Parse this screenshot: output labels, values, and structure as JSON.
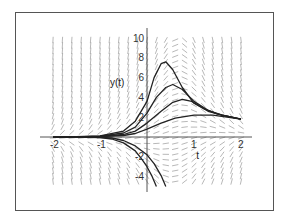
{
  "chart_data": {
    "type": "line",
    "title": "",
    "xlabel": "t",
    "ylabel": "y(t)",
    "xlim": [
      -2.1,
      2.1
    ],
    "ylim": [
      -5,
      10.5
    ],
    "grid": false,
    "legend": "none",
    "x_ticks": [
      {
        "value": -2,
        "label": "-2"
      },
      {
        "value": -1,
        "label": "-1"
      },
      {
        "value": 1,
        "label": "1"
      },
      {
        "value": 2,
        "label": "2"
      }
    ],
    "y_ticks": [
      {
        "value": 10,
        "label": "10"
      },
      {
        "value": 8,
        "label": "8"
      },
      {
        "value": 6,
        "label": "6"
      },
      {
        "value": 4,
        "label": "4"
      },
      {
        "value": 2,
        "label": "2"
      },
      {
        "value": -2,
        "label": "-2"
      },
      {
        "value": -4,
        "label": "-4"
      }
    ],
    "direction_field": {
      "description": "slope field",
      "t_range": [
        -2,
        2
      ],
      "y_range": [
        -4.5,
        10
      ]
    },
    "series": [
      {
        "name": "solution-1",
        "points": [
          [
            -2,
            0.01
          ],
          [
            -1.5,
            0.03
          ],
          [
            -1,
            0.12
          ],
          [
            -0.5,
            0.6
          ],
          [
            -0.25,
            1.6
          ],
          [
            0,
            3.6
          ],
          [
            0.15,
            6.0
          ],
          [
            0.3,
            7.4
          ],
          [
            0.4,
            7.6
          ],
          [
            0.55,
            6.8
          ],
          [
            0.75,
            5.0
          ],
          [
            1,
            3.4
          ],
          [
            1.3,
            2.6
          ],
          [
            1.6,
            2.2
          ],
          [
            2,
            1.8
          ]
        ]
      },
      {
        "name": "solution-2",
        "points": [
          [
            -2,
            0.01
          ],
          [
            -1.5,
            0.02
          ],
          [
            -1,
            0.08
          ],
          [
            -0.5,
            0.4
          ],
          [
            -0.25,
            1.0
          ],
          [
            0,
            2.4
          ],
          [
            0.2,
            4.0
          ],
          [
            0.4,
            5.0
          ],
          [
            0.55,
            5.3
          ],
          [
            0.75,
            4.8
          ],
          [
            1,
            3.6
          ],
          [
            1.3,
            2.7
          ],
          [
            1.6,
            2.2
          ],
          [
            2,
            1.8
          ]
        ]
      },
      {
        "name": "solution-3",
        "points": [
          [
            -2,
            0.0
          ],
          [
            -1.5,
            0.01
          ],
          [
            -1,
            0.05
          ],
          [
            -0.5,
            0.25
          ],
          [
            -0.25,
            0.6
          ],
          [
            0,
            1.4
          ],
          [
            0.3,
            2.6
          ],
          [
            0.55,
            3.5
          ],
          [
            0.75,
            3.8
          ],
          [
            0.95,
            3.6
          ],
          [
            1.2,
            2.9
          ],
          [
            1.5,
            2.3
          ],
          [
            2,
            1.8
          ]
        ]
      },
      {
        "name": "solution-4",
        "points": [
          [
            -2,
            0.0
          ],
          [
            -1.5,
            0.01
          ],
          [
            -1,
            0.03
          ],
          [
            -0.5,
            0.15
          ],
          [
            -0.25,
            0.35
          ],
          [
            0,
            0.8
          ],
          [
            0.3,
            1.4
          ],
          [
            0.6,
            1.9
          ],
          [
            1,
            2.2
          ],
          [
            1.4,
            2.2
          ],
          [
            2,
            1.8
          ]
        ]
      },
      {
        "name": "solution-5",
        "points": [
          [
            -2,
            0.0
          ],
          [
            -1.5,
            -0.01
          ],
          [
            -1,
            -0.05
          ],
          [
            -0.75,
            -0.2
          ],
          [
            -0.5,
            -0.6
          ],
          [
            -0.25,
            -1.4
          ],
          [
            -0.1,
            -2.3
          ],
          [
            0,
            -3.0
          ],
          [
            0.1,
            -3.9
          ],
          [
            0.2,
            -5.0
          ]
        ]
      },
      {
        "name": "solution-6",
        "points": [
          [
            -2,
            0.0
          ],
          [
            -1.5,
            -0.01
          ],
          [
            -1,
            -0.03
          ],
          [
            -0.75,
            -0.1
          ],
          [
            -0.5,
            -0.35
          ],
          [
            -0.25,
            -0.9
          ],
          [
            0,
            -1.8
          ],
          [
            0.15,
            -2.7
          ],
          [
            0.3,
            -3.9
          ],
          [
            0.4,
            -5.0
          ]
        ]
      }
    ]
  }
}
